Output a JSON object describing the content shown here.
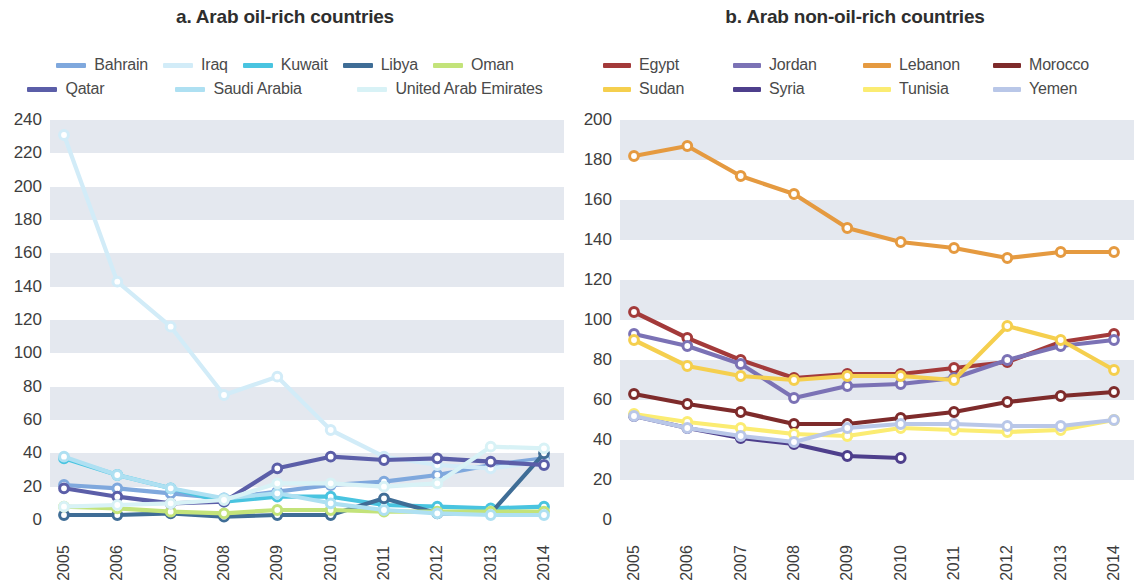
{
  "panels": [
    {
      "id": "a",
      "title": "a. Arab oil-rich countries",
      "legend_rows": [
        [
          {
            "label": "Bahrain",
            "color": "#7fa8dd"
          },
          {
            "label": "Iraq",
            "color": "#d2ecf8"
          },
          {
            "label": "Kuwait",
            "color": "#49c4e0"
          },
          {
            "label": "Libya",
            "color": "#3f6d96"
          },
          {
            "label": "Oman",
            "color": "#c3e37a"
          }
        ],
        [
          {
            "label": "Qatar",
            "color": "#5b5ea8"
          },
          {
            "label": "Saudi Arabia",
            "color": "#aee0f2"
          },
          {
            "label": "United Arab Emirates",
            "color": "#d8f2f6"
          }
        ]
      ]
    },
    {
      "id": "b",
      "title": "b. Arab non-oil-rich countries",
      "legend_rows": [
        [
          {
            "label": "Egypt",
            "color": "#a33a3a"
          },
          {
            "label": "Jordan",
            "color": "#7b72b5"
          },
          {
            "label": "Lebanon",
            "color": "#e59a40"
          },
          {
            "label": "Morocco",
            "color": "#7e2b2b"
          }
        ],
        [
          {
            "label": "Sudan",
            "color": "#f5cf4e"
          },
          {
            "label": "Syria",
            "color": "#4e3f8c"
          },
          {
            "label": "Tunisia",
            "color": "#fbec72"
          },
          {
            "label": "Yemen",
            "color": "#b9c7e8"
          }
        ]
      ]
    }
  ],
  "chart_data": [
    {
      "type": "line",
      "title": "a. Arab oil-rich countries",
      "xlabel": "",
      "ylabel": "",
      "categories": [
        "2005",
        "2006",
        "2007",
        "2008",
        "2009",
        "2010",
        "2011",
        "2012",
        "2013",
        "2014"
      ],
      "ylim": [
        0,
        240
      ],
      "ytick_step": 20,
      "yticks": [
        0,
        20,
        40,
        60,
        80,
        100,
        120,
        140,
        160,
        180,
        200,
        220,
        240
      ],
      "grid": "horizontal-bands",
      "legend_position": "top",
      "series": [
        {
          "name": "Bahrain",
          "color": "#7fa8dd",
          "values": [
            21,
            19,
            16,
            13,
            17,
            21,
            23,
            27,
            33,
            37
          ]
        },
        {
          "name": "Iraq",
          "color": "#d2ecf8",
          "values": [
            231,
            143,
            116,
            75,
            86,
            54,
            38,
            33,
            31,
            35
          ]
        },
        {
          "name": "Kuwait",
          "color": "#49c4e0",
          "values": [
            37,
            27,
            19,
            11,
            14,
            14,
            9,
            8,
            7,
            8
          ]
        },
        {
          "name": "Libya",
          "color": "#3f6d96",
          "values": [
            3,
            3,
            4,
            2,
            3,
            3,
            13,
            4,
            4,
            40
          ]
        },
        {
          "name": "Oman",
          "color": "#c3e37a",
          "values": [
            8,
            7,
            5,
            4,
            6,
            6,
            5,
            5,
            5,
            5
          ]
        },
        {
          "name": "Qatar",
          "color": "#5b5ea8",
          "values": [
            19,
            14,
            10,
            11,
            31,
            38,
            36,
            37,
            35,
            33
          ]
        },
        {
          "name": "Saudi Arabia",
          "color": "#aee0f2",
          "values": [
            38,
            27,
            19,
            13,
            16,
            10,
            6,
            4,
            3,
            3
          ]
        },
        {
          "name": "United Arab Emirates",
          "color": "#d8f2f6",
          "values": [
            8,
            9,
            10,
            12,
            22,
            22,
            20,
            22,
            44,
            43
          ]
        }
      ]
    },
    {
      "type": "line",
      "title": "b. Arab non-oil-rich countries",
      "xlabel": "",
      "ylabel": "",
      "categories": [
        "2005",
        "2006",
        "2007",
        "2008",
        "2009",
        "2010",
        "2011",
        "2012",
        "2013",
        "2014"
      ],
      "ylim": [
        0,
        200
      ],
      "ytick_step": 20,
      "yticks": [
        0,
        20,
        40,
        60,
        80,
        100,
        120,
        140,
        160,
        180,
        200
      ],
      "grid": "horizontal-bands",
      "legend_position": "top",
      "series": [
        {
          "name": "Egypt",
          "color": "#a33a3a",
          "values": [
            104,
            91,
            80,
            71,
            73,
            73,
            76,
            79,
            89,
            93
          ]
        },
        {
          "name": "Jordan",
          "color": "#7b72b5",
          "values": [
            93,
            87,
            78,
            61,
            67,
            68,
            71,
            80,
            87,
            90
          ]
        },
        {
          "name": "Lebanon",
          "color": "#e59a40",
          "values": [
            182,
            187,
            172,
            163,
            146,
            139,
            136,
            131,
            134,
            134
          ]
        },
        {
          "name": "Morocco",
          "color": "#7e2b2b",
          "values": [
            63,
            58,
            54,
            48,
            48,
            51,
            54,
            59,
            62,
            64
          ]
        },
        {
          "name": "Sudan",
          "color": "#f5cf4e",
          "values": [
            90,
            77,
            72,
            70,
            72,
            72,
            70,
            97,
            90,
            75
          ]
        },
        {
          "name": "Syria",
          "color": "#4e3f8c",
          "values": [
            52,
            46,
            41,
            38,
            32,
            31
          ]
        },
        {
          "name": "Tunisia",
          "color": "#fbec72",
          "values": [
            53,
            49,
            46,
            43,
            42,
            46,
            45,
            44,
            45,
            50
          ]
        },
        {
          "name": "Yemen",
          "color": "#b9c7e8",
          "values": [
            52,
            46,
            42,
            39,
            46,
            48,
            48,
            47,
            47,
            50
          ]
        }
      ]
    }
  ]
}
